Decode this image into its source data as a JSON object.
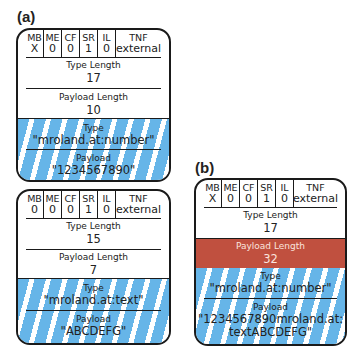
{
  "panels": [
    {
      "label": "(a)",
      "records": [
        {
          "header": {
            "flags": [
              {
                "name": "MB",
                "value": "X"
              },
              {
                "name": "ME",
                "value": "0"
              },
              {
                "name": "CF",
                "value": "0"
              },
              {
                "name": "SR",
                "value": "1"
              },
              {
                "name": "IL",
                "value": "0"
              },
              {
                "name": "TNF",
                "value": "external"
              }
            ]
          },
          "type_length": {
            "label": "Type Length",
            "value": "17"
          },
          "payload_length": {
            "label": "Payload Length",
            "value": "10"
          },
          "type": {
            "label": "Type",
            "value": "\"mroland.at:number\""
          },
          "payload": {
            "label": "Payload",
            "value": "\"1234567890\""
          }
        },
        {
          "header": {
            "flags": [
              {
                "name": "MB",
                "value": "0"
              },
              {
                "name": "ME",
                "value": "0"
              },
              {
                "name": "CF",
                "value": "0"
              },
              {
                "name": "SR",
                "value": "1"
              },
              {
                "name": "IL",
                "value": "0"
              },
              {
                "name": "TNF",
                "value": "external"
              }
            ]
          },
          "type_length": {
            "label": "Type Length",
            "value": "15"
          },
          "payload_length": {
            "label": "Payload Length",
            "value": "7"
          },
          "type": {
            "label": "Type",
            "value": "\"mroland.at:text\""
          },
          "payload": {
            "label": "Payload",
            "value": "\"ABCDEFG\""
          }
        }
      ]
    },
    {
      "label": "(b)",
      "records": [
        {
          "header": {
            "flags": [
              {
                "name": "MB",
                "value": "X"
              },
              {
                "name": "ME",
                "value": "0"
              },
              {
                "name": "CF",
                "value": "0"
              },
              {
                "name": "SR",
                "value": "1"
              },
              {
                "name": "IL",
                "value": "0"
              },
              {
                "name": "TNF",
                "value": "external"
              }
            ]
          },
          "type_length": {
            "label": "Type Length",
            "value": "17"
          },
          "payload_length": {
            "label": "Payload Length",
            "value": "32",
            "highlight": true
          },
          "type": {
            "label": "Type",
            "value": "\"mroland.at:number\""
          },
          "payload": {
            "label": "Payload",
            "value_line1": "\"1234567890mroland.at:",
            "value_line2": "textABCDEFG\""
          }
        }
      ]
    }
  ],
  "colors": {
    "stripe_blue": "#66b5e8",
    "highlight_red": "#c0503f",
    "border": "#1a1a1a"
  }
}
